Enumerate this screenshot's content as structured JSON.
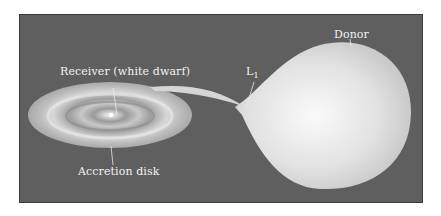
{
  "diagram": {
    "labels": {
      "receiver": "Receiver (white dwarf)",
      "l1": "L",
      "l1_sub": "1",
      "donor": "Donor",
      "disk": "Accretion disk"
    },
    "colors": {
      "background": "#5f5f5f",
      "frame_border": "#3a3a3a",
      "star": "#e6e6e6",
      "disk": "#cfcfcf",
      "label_text": "#f2f2f2"
    }
  }
}
